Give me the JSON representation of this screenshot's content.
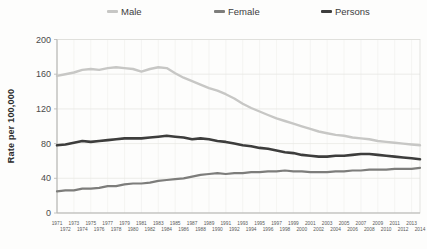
{
  "chart_data": {
    "type": "line",
    "title": "",
    "xlabel": "",
    "ylabel": "Rate per 100,000",
    "ylim": [
      0,
      200
    ],
    "yticks": [
      0,
      40,
      80,
      120,
      160,
      200
    ],
    "grid": true,
    "legend_position": "top",
    "x": [
      1971,
      1972,
      1973,
      1974,
      1975,
      1976,
      1977,
      1978,
      1979,
      1980,
      1981,
      1982,
      1983,
      1984,
      1985,
      1986,
      1987,
      1988,
      1989,
      1990,
      1991,
      1992,
      1993,
      1994,
      1995,
      1996,
      1997,
      1998,
      1999,
      2000,
      2001,
      2002,
      2003,
      2004,
      2005,
      2006,
      2007,
      2008,
      2009,
      2010,
      2011,
      2012,
      2013,
      2014
    ],
    "series": [
      {
        "name": "Male",
        "color": "#c7c7c5",
        "values": [
          158,
          160,
          162,
          165,
          166,
          165,
          167,
          168,
          167,
          166,
          163,
          166,
          168,
          167,
          161,
          156,
          152,
          148,
          144,
          141,
          137,
          132,
          126,
          121,
          117,
          113,
          109,
          106,
          103,
          100,
          97,
          94,
          92,
          90,
          89,
          87,
          86,
          85,
          83,
          82,
          81,
          80,
          79,
          78
        ]
      },
      {
        "name": "Female",
        "color": "#7d7d7b",
        "values": [
          25,
          26,
          26,
          28,
          28,
          29,
          31,
          31,
          33,
          34,
          34,
          35,
          37,
          38,
          39,
          40,
          42,
          44,
          45,
          46,
          45,
          46,
          46,
          47,
          47,
          48,
          48,
          49,
          48,
          48,
          47,
          47,
          47,
          48,
          48,
          49,
          49,
          50,
          50,
          50,
          51,
          51,
          51,
          52
        ]
      },
      {
        "name": "Persons",
        "color": "#3d3d3c",
        "values": [
          78,
          79,
          81,
          83,
          82,
          83,
          84,
          85,
          86,
          86,
          86,
          87,
          88,
          89,
          88,
          87,
          85,
          86,
          85,
          83,
          82,
          80,
          78,
          77,
          75,
          74,
          72,
          70,
          69,
          67,
          66,
          65,
          65,
          66,
          66,
          67,
          68,
          68,
          67,
          66,
          65,
          64,
          63,
          62
        ]
      }
    ]
  }
}
